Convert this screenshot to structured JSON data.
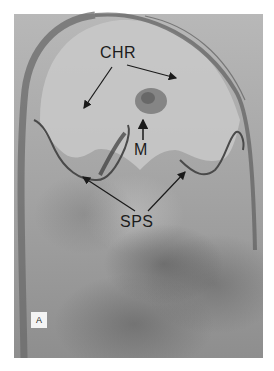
{
  "figure": {
    "panel_label": "A",
    "labels": {
      "chr": "CHR",
      "m": "M",
      "sps": "SPS"
    }
  }
}
